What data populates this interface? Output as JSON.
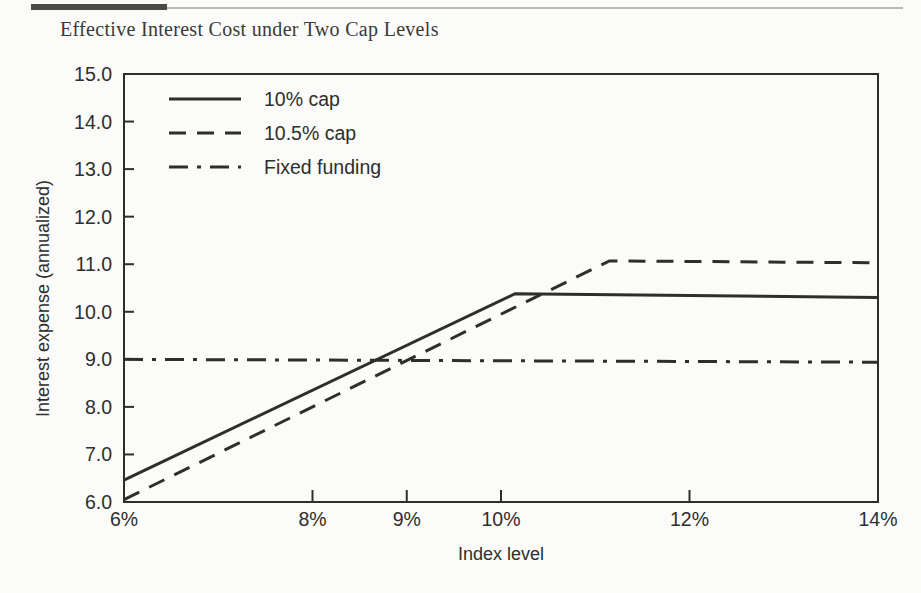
{
  "page": {
    "background_color": "#fbfbf9",
    "rule_color": "#4a4a48"
  },
  "title": "Effective Interest Cost under Two Cap Levels",
  "chart_data": {
    "type": "line",
    "title": "Effective Interest Cost under Two Cap Levels",
    "xlabel": "Index level",
    "ylabel": "Interest expense (annualized)",
    "xlim": [
      6,
      14
    ],
    "ylim": [
      6.0,
      15.0
    ],
    "grid": false,
    "legend_position": "top-left inside axes",
    "xticks": [
      6,
      8,
      9,
      10,
      12,
      14
    ],
    "xtick_labels": [
      "6%",
      "8%",
      "9%",
      "10%",
      "12%",
      "14%"
    ],
    "yticks": [
      6.0,
      7.0,
      8.0,
      9.0,
      10.0,
      11.0,
      12.0,
      13.0,
      14.0,
      15.0
    ],
    "ytick_labels": [
      "6.0",
      "7.0",
      "8.0",
      "9.0",
      "10.0",
      "11.0",
      "12.0",
      "13.0",
      "14.0",
      "15.0"
    ],
    "series": [
      {
        "name": "10% cap",
        "style": "solid",
        "color": "#2e2e2c",
        "x": [
          6.0,
          10.15,
          14.0
        ],
        "values": [
          6.46,
          10.38,
          10.3
        ]
      },
      {
        "name": "10.5% cap",
        "style": "dashed",
        "color": "#2e2e2c",
        "x": [
          6.0,
          11.15,
          14.0
        ],
        "values": [
          6.05,
          11.07,
          11.03
        ]
      },
      {
        "name": "Fixed funding",
        "style": "dashdot",
        "color": "#2e2e2c",
        "x": [
          6.0,
          14.0
        ],
        "values": [
          9.0,
          8.94
        ]
      }
    ]
  },
  "legend": {
    "items": [
      {
        "label": "10% cap",
        "style": "solid"
      },
      {
        "label": "10.5% cap",
        "style": "dashed"
      },
      {
        "label": "Fixed funding",
        "style": "dashdot"
      }
    ]
  }
}
